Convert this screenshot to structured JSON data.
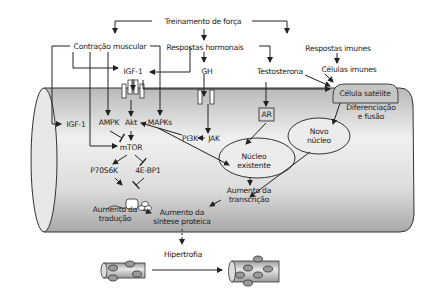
{
  "diagram": {
    "title": "Treinamento de força",
    "top_level": {
      "contracao": "Contração muscular",
      "hormonais": "Respostas hormonais",
      "imunes": "Respostas imunes"
    },
    "hormones": {
      "igf1_top": "IGF-1",
      "gh": "GH",
      "testosterona": "Testosterona"
    },
    "immune": {
      "celulas_imunes": "Células imunes",
      "celula_satelite": "Célula satélite",
      "diferenciacao_line1": "Diferenciação",
      "diferenciacao_line2": "e fusão"
    },
    "intracellular": {
      "igf1_inner": "IGF-1",
      "ampk": "AMPK",
      "akt": "Akt",
      "mapks": "MAPKs",
      "pi3k": "PI3K",
      "jak": "JAK",
      "ar": "AR",
      "mtor": "mTOR",
      "p70s6k": "P70S6K",
      "ebp1": "4E-BP1"
    },
    "nuclei": {
      "novo_line1": "Novo",
      "novo_line2": "núcleo",
      "existente_line1": "Núcleo",
      "existente_line2": "existente"
    },
    "outcomes": {
      "transcricao_line1": "Aumento da",
      "transcricao_line2": "transcrição",
      "traducao_line1": "Aumento da",
      "traducao_line2": "tradução",
      "sintese_line1": "Aumento da",
      "sintese_line2": "síntese proteica",
      "hipertrofia": "Hipertrofia"
    },
    "colors": {
      "fiber_fill_light": "#f2f2f2",
      "fiber_fill_dark": "#a9a9a9",
      "satellite_fill": "#c8c8c8",
      "nucleus_fill": "#ececec",
      "line": "#222222"
    }
  }
}
